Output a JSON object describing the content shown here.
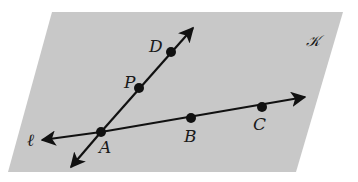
{
  "diagram": {
    "plane": {
      "label": "𝒦",
      "fill": "#c8c8c8",
      "corners": [
        [
          52,
          12
        ],
        [
          343,
          12
        ],
        [
          296,
          172
        ],
        [
          8,
          172
        ]
      ]
    },
    "line_l": {
      "label": "ℓ",
      "from": [
        42,
        140
      ],
      "to": [
        305,
        97
      ]
    },
    "line_ad": {
      "from": [
        71,
        167
      ],
      "to": [
        193,
        28
      ]
    },
    "points": [
      {
        "name": "A",
        "x": 101,
        "y": 132
      },
      {
        "name": "B",
        "x": 191,
        "y": 118
      },
      {
        "name": "C",
        "x": 262,
        "y": 107
      },
      {
        "name": "P",
        "x": 139,
        "y": 88
      },
      {
        "name": "D",
        "x": 171,
        "y": 52
      }
    ],
    "labels": {
      "A": "A",
      "B": "B",
      "C": "C",
      "P": "P",
      "D": "D",
      "l": "ℓ",
      "K": "𝒦"
    },
    "stroke_color": "#111111"
  }
}
